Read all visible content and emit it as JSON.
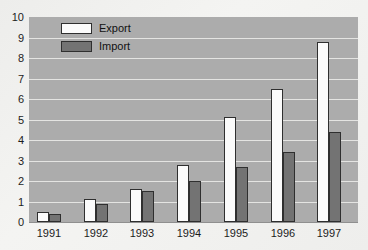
{
  "chart_data": {
    "type": "bar",
    "title": "",
    "xlabel": "",
    "ylabel": "",
    "categories": [
      "1991",
      "1992",
      "1993",
      "1994",
      "1995",
      "1996",
      "1997"
    ],
    "series": [
      {
        "name": "Export",
        "color": "#fbfbfb",
        "values": [
          0.5,
          1.1,
          1.6,
          2.8,
          5.1,
          6.5,
          8.8
        ]
      },
      {
        "name": "Import",
        "color": "#737373",
        "values": [
          0.4,
          0.9,
          1.5,
          2.0,
          2.7,
          3.4,
          4.4
        ]
      }
    ],
    "ylim": [
      0,
      10
    ],
    "ytick_step": 1,
    "ytick_labels": [
      "0",
      "1",
      "2",
      "3",
      "4",
      "5",
      "6",
      "7",
      "8",
      "9",
      "10"
    ],
    "grid": true,
    "legend_position": "top-left-inside"
  },
  "colors": {
    "page_bg": "#f2f2f0",
    "plot_bg": "#acacac",
    "gridline": "#e4e4e2",
    "bar_border": "#2f2f2f",
    "text": "#1c1c1c"
  }
}
